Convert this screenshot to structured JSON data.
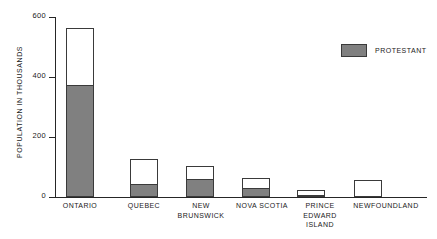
{
  "chart_data": {
    "type": "bar",
    "title": "",
    "subtitle": "",
    "xlabel": "",
    "ylabel": "POPULATION IN THOUSANDS",
    "ylim": [
      0,
      600
    ],
    "yticks": [
      0,
      200,
      400,
      600
    ],
    "ytick_labels": [
      "0",
      "200",
      "400",
      "600"
    ],
    "grid": false,
    "stacked": true,
    "legend_position": "top-right",
    "categories": [
      "ONTARIO",
      "QUEBEC",
      "NEW\nBRUNSWICK",
      "NOVA SCOTIA",
      "PRINCE\nEDWARD\nISLAND",
      "NEWFOUNDLAND"
    ],
    "series": [
      {
        "name": "PROTESTANT",
        "color": "#808080",
        "values": [
          375,
          43,
          60,
          30,
          8,
          0
        ]
      },
      {
        "name": "TOTAL",
        "color": "#ffffff",
        "values": [
          563,
          126,
          103,
          63,
          25,
          57
        ]
      }
    ]
  },
  "legend": {
    "entries": [
      {
        "label": "PROTESTANT",
        "color": "#808080"
      }
    ]
  },
  "axis": {
    "y_title": "POPULATION IN THOUSANDS"
  },
  "colors": {
    "protestant_fill": "#808080",
    "total_fill": "#ffffff",
    "outline": "#3a3a3a",
    "axis": "#262626",
    "background": "#ffffff"
  }
}
